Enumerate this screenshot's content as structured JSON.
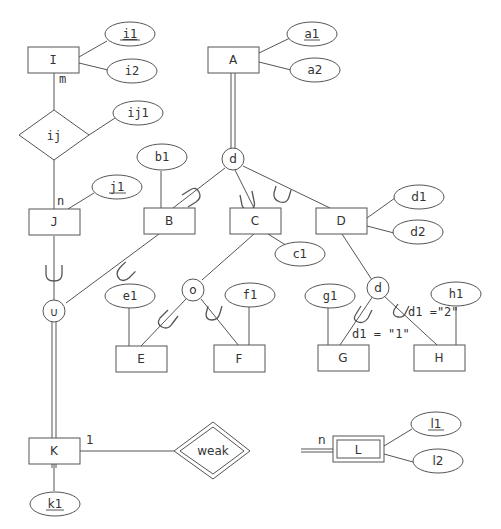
{
  "diagram": {
    "type": "EER diagram",
    "entities": {
      "I": "I",
      "J": "J",
      "A": "A",
      "B": "B",
      "C": "C",
      "D": "D",
      "E": "E",
      "F": "F",
      "G": "G",
      "H": "H",
      "K": "K",
      "L": "L"
    },
    "relationships": {
      "ij": "ij",
      "weak": "weak"
    },
    "attributes": {
      "i1": "i1",
      "i2": "i2",
      "ij1": "ij1",
      "j1": "j1",
      "a1": "a1",
      "a2": "a2",
      "b1": "b1",
      "c1": "c1",
      "d1": "d1",
      "d2": "d2",
      "e1": "e1",
      "f1": "f1",
      "g1": "g1",
      "h1": "h1",
      "k1": "k1",
      "l1": "l1",
      "l2": "l2"
    },
    "specialization_circles": {
      "A_disjoint": "d",
      "C_overlap": "o",
      "D_disjoint": "d",
      "union": "∪"
    },
    "cardinalities": {
      "I_ij": "m",
      "J_ij": "n",
      "K_weak": "1",
      "L_weak": "n"
    },
    "predicates": {
      "G": "d1 = \"1\"",
      "H": "d1 =\"2\""
    }
  }
}
